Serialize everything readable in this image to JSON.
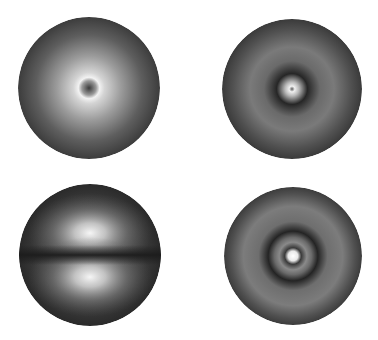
{
  "figure": {
    "background": "#ffffff",
    "panels": [
      {
        "id": "1s",
        "position": "top-left",
        "center": [
          89,
          88
        ],
        "radius": 71,
        "description": "spherical density, bright ring around dark center",
        "stops": [
          {
            "offset": "0%",
            "color": "#3a3a3a"
          },
          {
            "offset": "10%",
            "color": "#9a9a9a"
          },
          {
            "offset": "15%",
            "color": "#f2f2f2"
          },
          {
            "offset": "22%",
            "color": "#d4d4d4"
          },
          {
            "offset": "45%",
            "color": "#9c9c9c"
          },
          {
            "offset": "75%",
            "color": "#5e5e5e"
          },
          {
            "offset": "100%",
            "color": "#3c3c3c"
          }
        ]
      },
      {
        "id": "2s",
        "position": "top-right",
        "center": [
          292,
          89
        ],
        "radius": 70,
        "description": "spherical density, bright core, dark node ring",
        "stops": [
          {
            "offset": "0%",
            "color": "#5a5a5a"
          },
          {
            "offset": "4%",
            "color": "#f0f0f0"
          },
          {
            "offset": "10%",
            "color": "#b8b8b8"
          },
          {
            "offset": "22%",
            "color": "#262626"
          },
          {
            "offset": "40%",
            "color": "#6a6a6a"
          },
          {
            "offset": "60%",
            "color": "#7a7a7a"
          },
          {
            "offset": "85%",
            "color": "#505050"
          },
          {
            "offset": "100%",
            "color": "#3a3a3a"
          }
        ]
      },
      {
        "id": "2p",
        "position": "bottom-left",
        "center": [
          90,
          255
        ],
        "radius": 71,
        "description": "two lobes above and below a dark nodal plane",
        "lobe_offset_y": 22,
        "lobe_color": "#f4f4f4",
        "node_color": "#1c1c1c",
        "edge_color": "#2e2e2e"
      },
      {
        "id": "3s",
        "position": "bottom-right",
        "center": [
          293,
          256
        ],
        "radius": 69,
        "description": "spherical density, bright core with two dark node rings",
        "stops": [
          {
            "offset": "0%",
            "color": "#ffffff"
          },
          {
            "offset": "7%",
            "color": "#e8e8e8"
          },
          {
            "offset": "12%",
            "color": "#3a3a3a"
          },
          {
            "offset": "20%",
            "color": "#8a8a8a"
          },
          {
            "offset": "27%",
            "color": "#6a6a6a"
          },
          {
            "offset": "36%",
            "color": "#242424"
          },
          {
            "offset": "50%",
            "color": "#6e6e6e"
          },
          {
            "offset": "72%",
            "color": "#7c7c7c"
          },
          {
            "offset": "90%",
            "color": "#505050"
          },
          {
            "offset": "100%",
            "color": "#3c3c3c"
          }
        ]
      }
    ]
  }
}
